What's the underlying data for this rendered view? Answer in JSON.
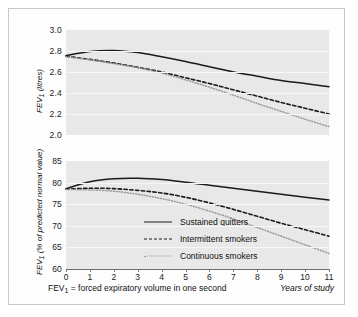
{
  "figure": {
    "caption_left_prefix": "FEV",
    "caption_left_sub": "1",
    "caption_left_rest": " = forced expiratory volume in one second",
    "caption_right": "Years of study"
  },
  "legend": {
    "position": "inside-lower-left",
    "items": [
      {
        "label": "Sustained quitters",
        "style": "solid",
        "color": "#1a1a1a"
      },
      {
        "label": "Intermittent smokers",
        "style": "dashed",
        "color": "#1a1a1a"
      },
      {
        "label": "Continuous smokers",
        "style": "dotted",
        "color": "#9a9a9a"
      }
    ]
  },
  "chart_data": [
    {
      "id": "top",
      "type": "line",
      "title": "",
      "xlabel": "Years of study",
      "ylabel": "FEV1 (litres)",
      "ylabel_prefix": "FEV",
      "ylabel_sub": "1",
      "ylabel_rest": " (litres)",
      "xlim": [
        0,
        11
      ],
      "ylim": [
        2.0,
        3.0
      ],
      "yticks": [
        2.0,
        2.2,
        2.4,
        2.6,
        2.8,
        3.0
      ],
      "ytick_labels": [
        "2.0",
        "2.2",
        "2.4",
        "2.6",
        "2.8",
        "3.0"
      ],
      "xticks": [
        0,
        1,
        2,
        3,
        4,
        5,
        6,
        7,
        8,
        9,
        10,
        11
      ],
      "xtick_labels": [
        "0",
        "1",
        "2",
        "3",
        "4",
        "5",
        "6",
        "7",
        "8",
        "9",
        "10",
        "11"
      ],
      "grid": true,
      "x": [
        0,
        1,
        2,
        3,
        4,
        5,
        6,
        7,
        8,
        9,
        10,
        11
      ],
      "series": [
        {
          "name": "Sustained quitters",
          "style": "solid",
          "color": "#1a1a1a",
          "values": [
            2.755,
            2.795,
            2.805,
            2.785,
            2.745,
            2.7,
            2.65,
            2.6,
            2.56,
            2.52,
            2.49,
            2.46
          ]
        },
        {
          "name": "Intermittent smokers",
          "style": "dashed",
          "color": "#1a1a1a",
          "values": [
            2.75,
            2.72,
            2.685,
            2.645,
            2.6,
            2.545,
            2.49,
            2.43,
            2.37,
            2.31,
            2.255,
            2.2
          ]
        },
        {
          "name": "Continuous smokers",
          "style": "dotted",
          "color": "#9a9a9a",
          "values": [
            2.745,
            2.715,
            2.68,
            2.64,
            2.59,
            2.525,
            2.455,
            2.38,
            2.3,
            2.225,
            2.15,
            2.08
          ]
        }
      ]
    },
    {
      "id": "bottom",
      "type": "line",
      "title": "",
      "xlabel": "Years of study",
      "ylabel": "FEV1 (% of predicted normal value)",
      "ylabel_prefix": "FEV",
      "ylabel_sub": "1",
      "ylabel_rest": " (% of predicted normal value)",
      "xlim": [
        0,
        11
      ],
      "ylim": [
        60,
        85
      ],
      "yticks": [
        60,
        65,
        70,
        75,
        80,
        85
      ],
      "ytick_labels": [
        "60",
        "65",
        "70",
        "75",
        "80",
        "85"
      ],
      "xticks": [
        0,
        1,
        2,
        3,
        4,
        5,
        6,
        7,
        8,
        9,
        10,
        11
      ],
      "xtick_labels": [
        "0",
        "1",
        "2",
        "3",
        "4",
        "5",
        "6",
        "7",
        "8",
        "9",
        "10",
        "11"
      ],
      "grid": true,
      "x": [
        0,
        1,
        2,
        3,
        4,
        5,
        6,
        7,
        8,
        9,
        10,
        11
      ],
      "series": [
        {
          "name": "Sustained quitters",
          "style": "solid",
          "color": "#1a1a1a",
          "values": [
            78.6,
            80.2,
            80.9,
            81.0,
            80.7,
            80.1,
            79.4,
            78.7,
            78.0,
            77.3,
            76.6,
            76.0
          ]
        },
        {
          "name": "Intermittent smokers",
          "style": "dashed",
          "color": "#1a1a1a",
          "values": [
            78.5,
            78.7,
            78.6,
            78.2,
            77.6,
            76.6,
            75.3,
            73.8,
            72.2,
            70.6,
            69.1,
            67.6
          ]
        },
        {
          "name": "Continuous smokers",
          "style": "dotted",
          "color": "#9a9a9a",
          "values": [
            78.4,
            78.3,
            78.0,
            77.3,
            76.3,
            75.0,
            73.4,
            71.6,
            69.6,
            67.6,
            65.6,
            63.6
          ]
        }
      ]
    }
  ]
}
